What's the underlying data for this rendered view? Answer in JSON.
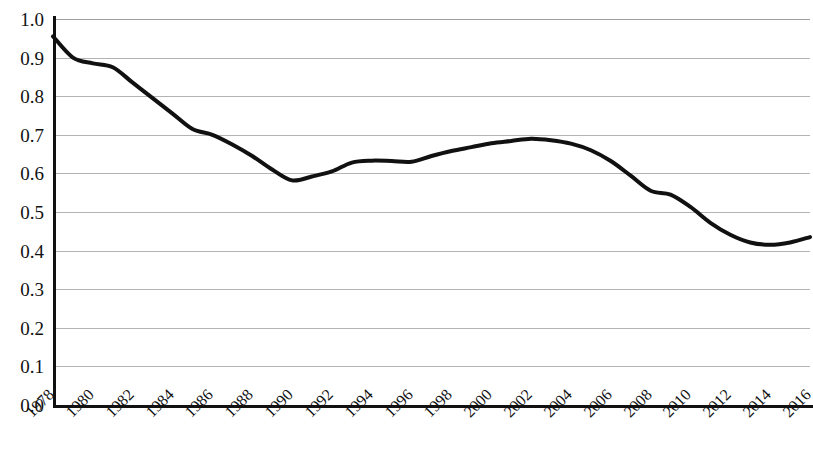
{
  "chart_data": {
    "type": "line",
    "title": "",
    "subtitle": "",
    "xlabel": "",
    "ylabel": "",
    "xlim": [
      1978,
      2016
    ],
    "ylim": [
      0.0,
      1.0
    ],
    "grid": true,
    "legend": false,
    "legend_position": "none",
    "line_color": "#111111",
    "line_width": 4,
    "gridline_color": "#b3b3b3",
    "axis_color": "#111111",
    "background": "#ffffff",
    "y_ticks": [
      "0.0",
      "0.1",
      "0.2",
      "0.3",
      "0.4",
      "0.5",
      "0.6",
      "0.7",
      "0.8",
      "0.9",
      "1.0"
    ],
    "y_tick_values": [
      0.0,
      0.1,
      0.2,
      0.3,
      0.4,
      0.5,
      0.6,
      0.7,
      0.8,
      0.9,
      1.0
    ],
    "x_ticks": [
      "1978",
      "1980",
      "1982",
      "1984",
      "1986",
      "1988",
      "1990",
      "1992",
      "1994",
      "1996",
      "1998",
      "2000",
      "2002",
      "2004",
      "2006",
      "2008",
      "2010",
      "2012",
      "2014",
      "2016"
    ],
    "x_tick_rotation": -45,
    "x": [
      1978,
      1979,
      1980,
      1981,
      1982,
      1983,
      1984,
      1985,
      1986,
      1987,
      1988,
      1989,
      1990,
      1991,
      1992,
      1993,
      1994,
      1995,
      1996,
      1997,
      1998,
      1999,
      2000,
      2001,
      2002,
      2003,
      2004,
      2005,
      2006,
      2007,
      2008,
      2009,
      2010,
      2011,
      2012,
      2013,
      2014,
      2015,
      2016
    ],
    "series": [
      {
        "name": "value",
        "values": [
          0.955,
          0.9,
          0.885,
          0.875,
          0.835,
          0.795,
          0.755,
          0.715,
          0.7,
          0.675,
          0.645,
          0.61,
          0.582,
          0.592,
          0.605,
          0.628,
          0.633,
          0.632,
          0.63,
          0.645,
          0.658,
          0.668,
          0.678,
          0.684,
          0.69,
          0.686,
          0.677,
          0.66,
          0.632,
          0.594,
          0.555,
          0.545,
          0.513,
          0.472,
          0.441,
          0.421,
          0.415,
          0.421,
          0.435
        ]
      }
    ],
    "annotations": []
  }
}
